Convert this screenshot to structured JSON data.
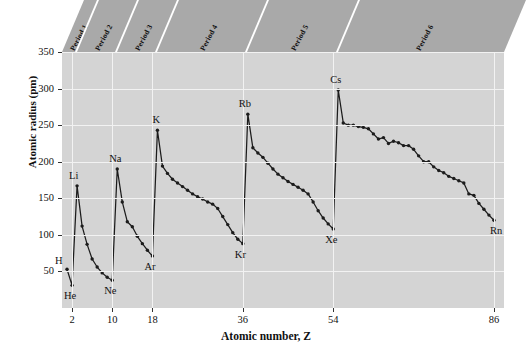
{
  "chart_data": {
    "type": "line",
    "title": "",
    "xlabel": "Atomic number, Z",
    "ylabel": "Atomic radius (pm)",
    "xlim": [
      0,
      88
    ],
    "ylim": [
      0,
      350
    ],
    "xticks": [
      2,
      10,
      18,
      36,
      54,
      86
    ],
    "yticks": [
      50,
      100,
      150,
      200,
      250,
      300,
      350
    ],
    "grid": true,
    "legend": "none",
    "series_name": "Atomic radius",
    "x": [
      1,
      2,
      3,
      4,
      5,
      6,
      7,
      8,
      9,
      10,
      11,
      12,
      13,
      14,
      15,
      16,
      17,
      18,
      19,
      20,
      21,
      22,
      23,
      24,
      25,
      26,
      27,
      28,
      29,
      30,
      31,
      32,
      33,
      34,
      35,
      36,
      37,
      38,
      39,
      40,
      41,
      42,
      43,
      44,
      45,
      46,
      47,
      48,
      49,
      50,
      51,
      52,
      53,
      54,
      55,
      56,
      57,
      58,
      59,
      60,
      61,
      62,
      63,
      64,
      65,
      66,
      67,
      68,
      69,
      70,
      71,
      72,
      73,
      74,
      75,
      76,
      77,
      78,
      79,
      80,
      81,
      82,
      83,
      84,
      85,
      86
    ],
    "values": [
      53,
      31,
      167,
      112,
      87,
      67,
      56,
      48,
      42,
      38,
      190,
      145,
      118,
      111,
      98,
      88,
      79,
      71,
      243,
      194,
      184,
      176,
      171,
      166,
      161,
      156,
      152,
      149,
      145,
      142,
      136,
      125,
      114,
      103,
      94,
      88,
      265,
      219,
      212,
      206,
      198,
      190,
      183,
      178,
      173,
      169,
      165,
      161,
      156,
      145,
      133,
      123,
      115,
      108,
      298,
      253,
      250,
      250,
      248,
      247,
      245,
      238,
      231,
      233,
      225,
      228,
      226,
      222,
      222,
      217,
      208,
      200,
      200,
      193,
      188,
      185,
      180,
      177,
      174,
      171,
      156,
      154,
      143,
      135,
      127,
      120
    ],
    "annotated_points": [
      {
        "label": "H",
        "z": 1,
        "r": 53,
        "dx": -12,
        "dy": -13
      },
      {
        "label": "He",
        "z": 2,
        "r": 31,
        "dx": -8,
        "dy": 6
      },
      {
        "label": "Li",
        "z": 3,
        "r": 167,
        "dx": -8,
        "dy": -15
      },
      {
        "label": "Ne",
        "z": 10,
        "r": 38,
        "dx": -8,
        "dy": 6
      },
      {
        "label": "Na",
        "z": 11,
        "r": 190,
        "dx": -8,
        "dy": -15
      },
      {
        "label": "Ar",
        "z": 18,
        "r": 71,
        "dx": -8,
        "dy": 6
      },
      {
        "label": "K",
        "z": 19,
        "r": 243,
        "dx": -5,
        "dy": -15
      },
      {
        "label": "Kr",
        "z": 36,
        "r": 88,
        "dx": -8,
        "dy": 6
      },
      {
        "label": "Rb",
        "z": 37,
        "r": 265,
        "dx": -9,
        "dy": -15
      },
      {
        "label": "Xe",
        "z": 54,
        "r": 108,
        "dx": -8,
        "dy": 6
      },
      {
        "label": "Cs",
        "z": 55,
        "r": 298,
        "dx": -8,
        "dy": -15
      },
      {
        "label": "Rn",
        "z": 86,
        "r": 120,
        "dx": -4,
        "dy": 6
      }
    ],
    "period_bands": [
      {
        "label": "Period 1",
        "z_start": 1,
        "z_end": 2
      },
      {
        "label": "Period 2",
        "z_start": 3,
        "z_end": 10
      },
      {
        "label": "Period 3",
        "z_start": 11,
        "z_end": 18
      },
      {
        "label": "Period 4",
        "z_start": 19,
        "z_end": 36
      },
      {
        "label": "Period 5",
        "z_start": 37,
        "z_end": 54
      },
      {
        "label": "Period 6",
        "z_start": 55,
        "z_end": 86
      }
    ],
    "colors": {
      "plot_background": "#d4d4d4",
      "band_background": "#a9a9a9",
      "gridline": "#f2f2f2",
      "line": "#1c1c1c",
      "text": "#111111",
      "page_background": "#ffffff"
    }
  }
}
